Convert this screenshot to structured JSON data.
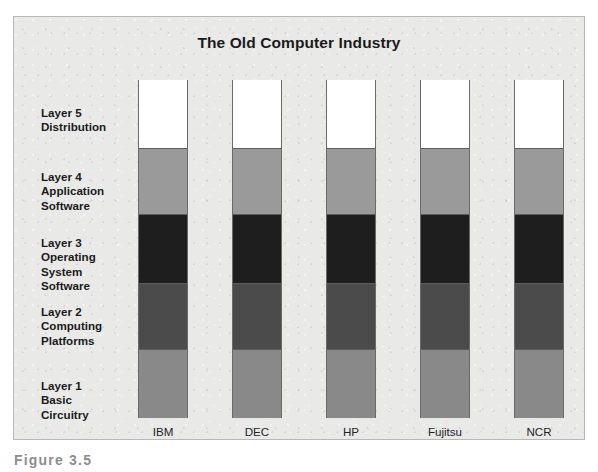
{
  "figure": {
    "title": "The Old Computer Industry",
    "caption": "Figure 3.5",
    "background_color": "#e9e9e7",
    "frame_border_color": "#b8b8b6"
  },
  "layers": [
    {
      "id": "layer-5",
      "label": "Layer 5\nDistribution",
      "name": "Distribution",
      "number": 5,
      "color": "#ffffff",
      "top_pct": 0,
      "height_pct": 20.1
    },
    {
      "id": "layer-4",
      "label": "Layer 4\nApplication\nSoftware",
      "name": "Application Software",
      "number": 4,
      "color": "#9a9a9a",
      "top_pct": 20.1,
      "height_pct": 19.5
    },
    {
      "id": "layer-3",
      "label": "Layer 3\nOperating\nSystem\nSoftware",
      "name": "Operating System Software",
      "number": 3,
      "color": "#1e1e1e",
      "top_pct": 39.6,
      "height_pct": 20.4
    },
    {
      "id": "layer-2",
      "label": "Layer 2\nComputing\nPlatforms",
      "name": "Computing Platforms",
      "number": 2,
      "color": "#4b4b4b",
      "top_pct": 60.0,
      "height_pct": 19.5
    },
    {
      "id": "layer-1",
      "label": "Layer 1\nBasic\nCircuitry",
      "name": "Basic Circuitry",
      "number": 1,
      "color": "#898989",
      "top_pct": 79.5,
      "height_pct": 20.5
    }
  ],
  "companies": [
    {
      "id": "ibm",
      "label": "IBM",
      "x": 137
    },
    {
      "id": "dec",
      "label": "DEC",
      "x": 231
    },
    {
      "id": "hp",
      "label": "HP",
      "x": 325
    },
    {
      "id": "fujitsu",
      "label": "Fujitsu",
      "x": 419
    },
    {
      "id": "ncr",
      "label": "NCR",
      "x": 513
    }
  ],
  "chart_data": {
    "type": "bar",
    "title": "The Old Computer Industry",
    "xlabel": "",
    "ylabel": "",
    "stacked": true,
    "grid": false,
    "legend_position": "left-labels",
    "categories": [
      "IBM",
      "DEC",
      "HP",
      "Fujitsu",
      "NCR"
    ],
    "series": [
      {
        "name": "Layer 1 Basic Circuitry",
        "color": "#898989",
        "values": [
          20.5,
          20.5,
          20.5,
          20.5,
          20.5
        ]
      },
      {
        "name": "Layer 2 Computing Platforms",
        "color": "#4b4b4b",
        "values": [
          19.5,
          19.5,
          19.5,
          19.5,
          19.5
        ]
      },
      {
        "name": "Layer 3 Operating System Software",
        "color": "#1e1e1e",
        "values": [
          20.4,
          20.4,
          20.4,
          20.4,
          20.4
        ]
      },
      {
        "name": "Layer 4 Application Software",
        "color": "#9a9a9a",
        "values": [
          19.5,
          19.5,
          19.5,
          19.5,
          19.5
        ]
      },
      {
        "name": "Layer 5 Distribution",
        "color": "#ffffff",
        "values": [
          20.1,
          20.1,
          20.1,
          20.1,
          20.1
        ]
      }
    ],
    "ylim": [
      0,
      100
    ],
    "annotation": "Every company is vertically integrated across all five layers."
  }
}
